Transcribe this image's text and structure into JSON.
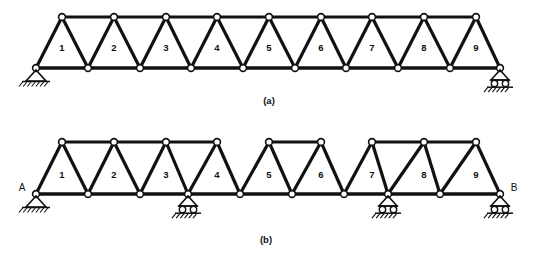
{
  "figure": {
    "title_visible": false,
    "background_color": "#ffffff",
    "ink_color": "#111111",
    "node_fill": "#ffffff",
    "subfigures": [
      {
        "id": "a",
        "caption": "(a)",
        "caption_x": 269,
        "caption_y": 101,
        "description": "Simply supported Warren truss, nine panels, continuous top chord",
        "span_x0": 36,
        "span_x1": 500,
        "top_y": 17,
        "bottom_y": 68,
        "panel_labels": [
          "1",
          "2",
          "3",
          "4",
          "5",
          "6",
          "7",
          "8",
          "9"
        ],
        "panel_label_x": [
          62,
          114,
          166,
          217,
          269,
          321,
          372,
          424,
          476
        ],
        "panel_label_y": 48,
        "bottom_nodes_x": [
          36,
          88,
          140,
          191,
          243,
          295,
          346,
          398,
          450,
          500
        ],
        "top_nodes_x": [
          62,
          114,
          166,
          217,
          269,
          321,
          372,
          424,
          476
        ],
        "top_chord_segments": [
          [
            62,
            476
          ]
        ],
        "bottom_chord_segments": [
          [
            36,
            500
          ]
        ],
        "supports": [
          {
            "type": "pin",
            "x": 36,
            "y": 68,
            "label": ""
          },
          {
            "type": "roller",
            "x": 500,
            "y": 68,
            "label": ""
          }
        ],
        "node_letters": []
      },
      {
        "id": "b",
        "caption": "(b)",
        "caption_x": 266,
        "caption_y": 240,
        "description": "Continuous Warren truss on four supports with two top-chord hinge gaps",
        "span_x0": 36,
        "span_x1": 500,
        "top_y": 142,
        "bottom_y": 194,
        "panel_labels": [
          "1",
          "2",
          "3",
          "4",
          "5",
          "6",
          "7",
          "8",
          "9"
        ],
        "panel_label_x": [
          62,
          114,
          166,
          217,
          269,
          321,
          372,
          424,
          476
        ],
        "panel_label_y": 175,
        "bottom_nodes_x": [
          36,
          88,
          140,
          188,
          240,
          292,
          344,
          388,
          440,
          500
        ],
        "top_nodes_x": [
          62,
          114,
          166,
          217,
          269,
          321,
          372,
          424,
          476
        ],
        "top_chord_segments": [
          [
            62,
            217
          ],
          [
            269,
            321
          ],
          [
            372,
            476
          ]
        ],
        "bottom_chord_segments": [
          [
            36,
            500
          ]
        ],
        "supports": [
          {
            "type": "pin",
            "x": 36,
            "y": 194,
            "label": "A"
          },
          {
            "type": "roller",
            "x": 188,
            "y": 194,
            "label": ""
          },
          {
            "type": "roller",
            "x": 388,
            "y": 194,
            "label": ""
          },
          {
            "type": "roller",
            "x": 500,
            "y": 194,
            "label": "B"
          }
        ],
        "node_letters": [
          {
            "text": "A",
            "x": 22,
            "y": 188
          },
          {
            "text": "B",
            "x": 514,
            "y": 188
          }
        ]
      }
    ]
  },
  "chart_data": {
    "type": "diagram",
    "title": "",
    "subfigure_captions": [
      "(a)",
      "(b)"
    ],
    "panel_numbers": [
      1,
      2,
      3,
      4,
      5,
      6,
      7,
      8,
      9
    ],
    "support_labels": [
      "A",
      "B"
    ],
    "subfigure_a": {
      "support_types": [
        "pin",
        "roller"
      ],
      "support_count": 2,
      "top_chord_continuous": true,
      "hinge_gaps": 0,
      "panels": 9
    },
    "subfigure_b": {
      "support_types": [
        "pin",
        "roller",
        "roller",
        "roller"
      ],
      "support_count": 4,
      "top_chord_continuous": false,
      "hinge_gaps": 2,
      "panels": 9
    }
  }
}
